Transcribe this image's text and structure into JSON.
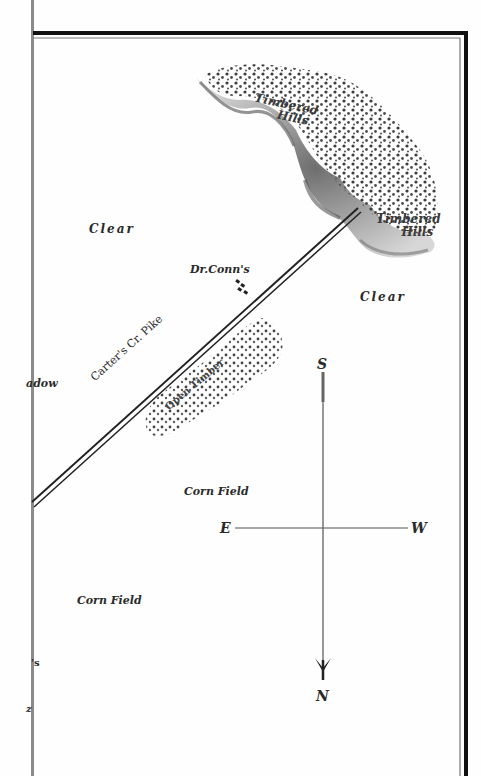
{
  "map": {
    "labels": {
      "timbered_hills_upper": [
        "Timbered",
        "Hills"
      ],
      "timbered_hills_lower": [
        "Timbered",
        "Hills"
      ],
      "clear_left": "Clear",
      "clear_right": "Clear",
      "dr_conns": "Dr.Conn's",
      "road": "Carter's Cr. Pike",
      "meadow_partial": "adow",
      "open_timber": "Open Timber",
      "corn_field_center": "Corn Field",
      "corn_field_lower": "Corn Field",
      "partial_label_1": "'s",
      "partial_label_2": "z"
    },
    "compass": {
      "south": "S",
      "north": "N",
      "east": "E",
      "west": "W"
    },
    "colors": {
      "ink": "#2a2a2a",
      "frame": "#111111",
      "gray_line": "#8a8a8a",
      "hill_shade": "#9a9a9a"
    }
  }
}
